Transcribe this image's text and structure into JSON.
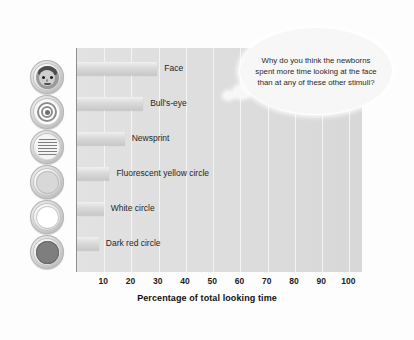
{
  "chart_data": {
    "type": "bar",
    "orientation": "horizontal",
    "title": "",
    "xlabel": "Percentage of total looking time",
    "ylabel": "",
    "xlim": [
      0,
      105
    ],
    "xticks": [
      10,
      20,
      30,
      40,
      50,
      60,
      70,
      80,
      90,
      100
    ],
    "grid": true,
    "legend": false,
    "categories": [
      "Face",
      "Bull's-eye",
      "Newsprint",
      "Fluorescent yellow circle",
      "White circle",
      "Dark red circle"
    ],
    "values": [
      29.5,
      24.3,
      17.5,
      11.9,
      9.8,
      8.0
    ],
    "annotations": [
      "Why do you think the newborns spent more time looking at the face than at any of these other stimuli?"
    ]
  },
  "axis": {
    "x_title": "Percentage of total looking time",
    "ticks": [
      "10",
      "20",
      "30",
      "40",
      "50",
      "60",
      "70",
      "80",
      "90",
      "100"
    ]
  },
  "bars": [
    {
      "label": "Face",
      "value": 29.5,
      "icon": "face-icon"
    },
    {
      "label": "Bull's-eye",
      "value": 24.3,
      "icon": "bullseye-icon"
    },
    {
      "label": "Newsprint",
      "value": 17.5,
      "icon": "newsprint-icon"
    },
    {
      "label": "Fluorescent yellow circle",
      "value": 11.9,
      "icon": "yellow-circle-icon"
    },
    {
      "label": "White circle",
      "value": 9.8,
      "icon": "white-circle-icon"
    },
    {
      "label": "Dark red circle",
      "value": 8.0,
      "icon": "dark-red-circle-icon"
    }
  ],
  "callout": {
    "text": "Why do you think the newborns spent more time looking at the face than at any of these other stimuli?"
  },
  "colors": {
    "plot_background": "#dedede",
    "bar_fill": "#dadada",
    "gridline": "#f4f4f4",
    "axis_line": "#8f8f8f",
    "text": "#1c1c1c",
    "callout_background": "#f7f7f7"
  }
}
